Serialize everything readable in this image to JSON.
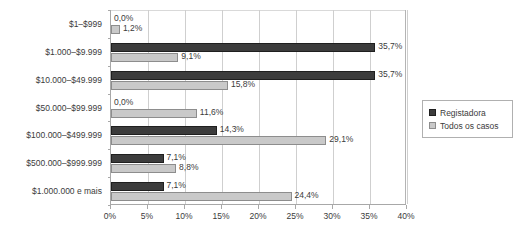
{
  "chart_data": {
    "type": "bar",
    "orientation": "horizontal",
    "title": "",
    "subtitle": "",
    "xlabel": "",
    "ylabel": "",
    "xlim": [
      0,
      40
    ],
    "xtick_labels": [
      "0%",
      "5%",
      "10%",
      "15%",
      "20%",
      "25%",
      "30%",
      "35%",
      "40%"
    ],
    "xtick_values": [
      0,
      5,
      10,
      15,
      20,
      25,
      30,
      35,
      40
    ],
    "grid": true,
    "legend_position": "right",
    "categories": [
      "$1–$999",
      "$1.000–$9.999",
      "$10.000–$49.999",
      "$50.000–$99.999",
      "$100.000–$499.999",
      "$500.000–$999.999",
      "$1.000.000 e mais"
    ],
    "series": [
      {
        "name": "Registadora",
        "color": "#3c3c3c",
        "values": [
          0.0,
          35.7,
          35.7,
          0.0,
          14.3,
          7.1,
          7.1
        ],
        "labels": [
          "0,0%",
          "35,7%",
          "35,7%",
          "0,0%",
          "14,3%",
          "7,1%",
          "7,1%"
        ]
      },
      {
        "name": "Todos os casos",
        "color": "#c9c9c9",
        "values": [
          1.2,
          9.1,
          15.8,
          11.6,
          29.1,
          8.8,
          24.4
        ],
        "labels": [
          "1,2%",
          "9,1%",
          "15,8%",
          "11,6%",
          "29,1%",
          "8,8%",
          "24,4%"
        ]
      }
    ]
  },
  "legend": {
    "items": [
      {
        "label": "Registadora",
        "swatch": "dark"
      },
      {
        "label": "Todos os casos",
        "swatch": "light"
      }
    ]
  }
}
